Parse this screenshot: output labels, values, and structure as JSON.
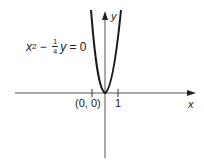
{
  "diagram": {
    "equation": {
      "var_x": "x",
      "exp": "2",
      "minus": " − ",
      "num": "1",
      "den": "4",
      "var_y": "y",
      "rhs": " = 0"
    },
    "axes": {
      "x_label": "x",
      "y_label": "y"
    },
    "ticks": {
      "origin_label": "(0, 0)",
      "one_label": "1"
    },
    "colors": {
      "curve": "#1a1a1a",
      "axis": "#555555"
    }
  }
}
